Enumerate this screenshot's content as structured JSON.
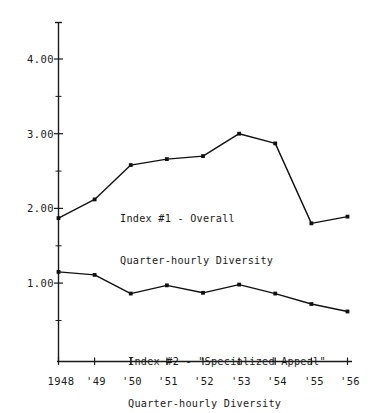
{
  "chart_data": {
    "type": "line",
    "title": "",
    "xlabel": "",
    "ylabel": "",
    "categories": [
      "1948",
      "'49",
      "'50",
      "'51",
      "'52",
      "'53",
      "'54",
      "'55",
      "'56"
    ],
    "x_tick_labels": [
      "1948",
      "'49",
      "'50",
      "'51",
      "'52",
      "'53",
      "'54",
      "'55",
      "'56"
    ],
    "y_tick_labels": [
      "1.00",
      "2.00",
      "3.00",
      "4.00"
    ],
    "y_tick_values": [
      1.0,
      2.0,
      3.0,
      4.0
    ],
    "ylim": [
      0.3,
      4.45
    ],
    "xlim": [
      1948,
      1956
    ],
    "grid": false,
    "legend_position": "inline-annotation",
    "series": [
      {
        "name": "Index #1 - Overall Quarter-hourly Diversity",
        "values": [
          1.87,
          2.12,
          2.58,
          2.66,
          2.7,
          3.0,
          2.87,
          1.8,
          1.89
        ],
        "color": "#111111",
        "marker": "square"
      },
      {
        "name": "Index #2 - \"Specialized Appeal\" Quarter-hourly Diversity",
        "values": [
          1.15,
          1.11,
          0.86,
          0.97,
          0.87,
          0.98,
          0.86,
          0.72,
          0.62
        ],
        "color": "#111111",
        "marker": "square"
      }
    ],
    "annotations": [
      {
        "id": "series1-label",
        "line1": "Index #1 - Overall",
        "line2": "Quarter-hourly Diversity"
      },
      {
        "id": "series2-label",
        "line1": "Index #2 - \"Specialized Appeal\"",
        "line2": "Quarter-hourly Diversity"
      }
    ]
  },
  "axes": {
    "y_labels": [
      {
        "text": "4.00",
        "top": 53
      },
      {
        "text": "3.00",
        "top": 128
      },
      {
        "text": "2.00",
        "top": 202
      },
      {
        "text": "1.00",
        "top": 277
      }
    ],
    "x_labels": [
      {
        "text": "1948",
        "left": 58
      },
      {
        "text": "'49",
        "left": 94
      },
      {
        "text": "'50",
        "left": 130
      },
      {
        "text": "'51",
        "left": 166
      },
      {
        "text": "'52",
        "left": 202
      },
      {
        "text": "'53",
        "left": 239
      },
      {
        "text": "'54",
        "left": 275
      },
      {
        "text": "'55",
        "left": 312
      },
      {
        "text": "'56",
        "left": 348
      }
    ]
  },
  "annotation_text": {
    "series1_line1": "Index #1 - Overall",
    "series1_line2": "Quarter-hourly Diversity",
    "series2_line1": "Index #2 - \"Specialized Appeal\"",
    "series2_line2": "Quarter-hourly Diversity"
  },
  "colors": {
    "line": "#111111",
    "axis": "#1a1a1a",
    "background": "#ffffff",
    "text": "#1a1a1a"
  }
}
